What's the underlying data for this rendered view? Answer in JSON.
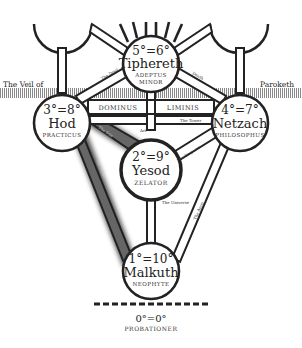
{
  "veil": {
    "left_label": "The Veil of",
    "right_label": "Paroketh"
  },
  "sephiroth": [
    {
      "id": "tiphereth",
      "grade": "5°=6°",
      "name": "Tiphereth",
      "title_line1": "Adeptus",
      "title_line2": "Minor"
    },
    {
      "id": "hod",
      "grade": "3°=8°",
      "name": "Hod",
      "title": "Practicus"
    },
    {
      "id": "netzach",
      "grade": "4°=7°",
      "name": "Netzach",
      "title": "Philosophus"
    },
    {
      "id": "yesod",
      "grade": "2°=9°",
      "name": "Yesod",
      "title": "Zelator"
    },
    {
      "id": "malkuth",
      "grade": "1°=10°",
      "name": "Malkuth",
      "title": "Neophyte"
    }
  ],
  "bars": {
    "dominus": "Dominus",
    "liminis": "Liminis"
  },
  "paths": {
    "devil": "The Devil",
    "death": "Death",
    "tower": "The Tower",
    "art": "Art",
    "sun": "The Sun",
    "emperor": "The Emperor",
    "universe": "The Universe",
    "moon": "The Moon",
    "aeon": "The Aeon"
  },
  "probationer": {
    "grade": "0°=0°",
    "title": "Probationer"
  }
}
